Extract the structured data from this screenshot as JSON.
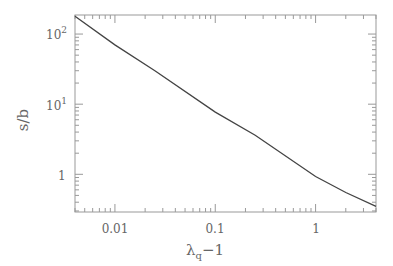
{
  "chart_data": {
    "type": "line",
    "title": "",
    "xlabel": "λ_q − 1",
    "ylabel": "s/b",
    "xscale": "log",
    "yscale": "log",
    "xlim": [
      0.004,
      4
    ],
    "ylim": [
      0.29,
      187
    ],
    "x_tick_labels": [
      "0.01",
      "0.1",
      "1"
    ],
    "y_tick_labels": [
      "1",
      "10¹",
      "10²"
    ],
    "grid": false,
    "legend": null,
    "series": [
      {
        "name": "s/b",
        "x": [
          0.004,
          0.01,
          0.025,
          0.1,
          0.25,
          1,
          2,
          4
        ],
        "y": [
          180,
          70,
          30,
          7.7,
          3.6,
          0.93,
          0.55,
          0.35
        ]
      }
    ]
  },
  "labels": {
    "xlabel_main": "λ",
    "xlabel_sub": "q",
    "xlabel_tail": "−1",
    "ylabel": "s/b",
    "xticks": [
      "0.01",
      "0.1",
      "1"
    ],
    "yticks": {
      "t0": "1",
      "t1_base": "10",
      "t1_exp": "1",
      "t2_base": "10",
      "t2_exp": "2"
    }
  }
}
